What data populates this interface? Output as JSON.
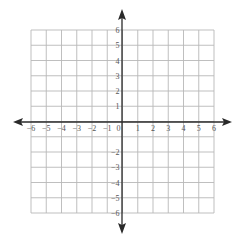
{
  "diagram": {
    "type": "coordinate-plane",
    "title": "",
    "x_axis": {
      "min": -6,
      "max": 6,
      "step": 1,
      "labels": [
        "−6",
        "−5",
        "−4",
        "−3",
        "−2",
        "−1",
        "0",
        "1",
        "2",
        "3",
        "4",
        "5",
        "6"
      ]
    },
    "y_axis": {
      "min": -6,
      "max": 6,
      "step": 1,
      "positive_labels": [
        "1",
        "2",
        "3",
        "4",
        "5",
        "6"
      ],
      "negative_labels": [
        "−2",
        "−3",
        "−4",
        "−5",
        "−6"
      ]
    },
    "grid": true,
    "arrows": [
      "left",
      "right",
      "up",
      "down"
    ],
    "colors": {
      "grid": "#b8b8b8",
      "axis": "#2a2a2a",
      "labels": "#555555",
      "background": "#ffffff"
    }
  }
}
